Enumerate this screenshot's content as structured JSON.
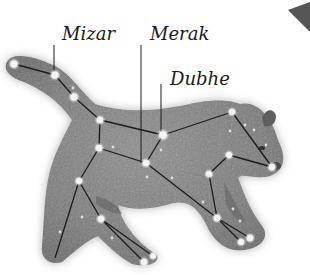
{
  "figure": {
    "labels": [
      {
        "id": "mizar",
        "text": "Mizar",
        "x": 62,
        "y": 25,
        "leader": {
          "x1": 54,
          "y1": 45,
          "x2": 54,
          "y2": 72
        }
      },
      {
        "id": "merak",
        "text": "Merak",
        "x": 150,
        "y": 25,
        "leader": {
          "x1": 141,
          "y1": 45,
          "x2": 141,
          "y2": 163
        }
      },
      {
        "id": "dubhe",
        "text": "Dubhe",
        "x": 170,
        "y": 70,
        "leader": {
          "x1": 161,
          "y1": 84,
          "x2": 161,
          "y2": 133
        }
      }
    ],
    "stars": [
      {
        "name": "tail-tip",
        "x": 14,
        "y": 64,
        "r": 3.5
      },
      {
        "name": "mizar",
        "x": 55,
        "y": 75,
        "r": 3.5
      },
      {
        "name": "alioth",
        "x": 74,
        "y": 97,
        "r": 3.5
      },
      {
        "name": "megrez",
        "x": 100,
        "y": 120,
        "r": 3.2
      },
      {
        "name": "dubhe",
        "x": 163,
        "y": 135,
        "r": 3.8
      },
      {
        "name": "merak",
        "x": 146,
        "y": 163,
        "r": 3.2
      },
      {
        "name": "phecda",
        "x": 99,
        "y": 148,
        "r": 3.2
      },
      {
        "name": "hip",
        "x": 79,
        "y": 181,
        "r": 3
      },
      {
        "name": "back-knee",
        "x": 101,
        "y": 219,
        "r": 3.2
      },
      {
        "name": "back-paw-1",
        "x": 144,
        "y": 262,
        "r": 3.2
      },
      {
        "name": "back-paw-2",
        "x": 153,
        "y": 256,
        "r": 2.8
      },
      {
        "name": "head-top",
        "x": 232,
        "y": 112,
        "r": 3
      },
      {
        "name": "nose",
        "x": 272,
        "y": 167,
        "r": 3.2
      },
      {
        "name": "neck",
        "x": 229,
        "y": 155,
        "r": 3
      },
      {
        "name": "shoulder",
        "x": 209,
        "y": 174,
        "r": 3
      },
      {
        "name": "front-knee",
        "x": 217,
        "y": 218,
        "r": 3.2
      },
      {
        "name": "front-paw-1",
        "x": 241,
        "y": 242,
        "r": 3
      },
      {
        "name": "front-paw-2",
        "x": 250,
        "y": 238,
        "r": 3.2
      }
    ],
    "minor_stars": [
      {
        "x": 49,
        "y": 62
      },
      {
        "x": 73,
        "y": 88
      },
      {
        "x": 98,
        "y": 100
      },
      {
        "x": 245,
        "y": 125
      },
      {
        "x": 266,
        "y": 145
      },
      {
        "x": 254,
        "y": 130
      },
      {
        "x": 172,
        "y": 178
      },
      {
        "x": 147,
        "y": 177
      },
      {
        "x": 42,
        "y": 185
      },
      {
        "x": 60,
        "y": 232
      },
      {
        "x": 112,
        "y": 238
      },
      {
        "x": 203,
        "y": 202
      },
      {
        "x": 233,
        "y": 209
      },
      {
        "x": 240,
        "y": 221
      },
      {
        "x": 161,
        "y": 150
      },
      {
        "x": 113,
        "y": 147
      },
      {
        "x": 82,
        "y": 217
      },
      {
        "x": 230,
        "y": 131
      }
    ],
    "lines": [
      [
        "tail-tip",
        "mizar"
      ],
      [
        "mizar",
        "alioth"
      ],
      [
        "alioth",
        "megrez"
      ],
      [
        "megrez",
        "dubhe"
      ],
      [
        "dubhe",
        "merak"
      ],
      [
        "merak",
        "phecda"
      ],
      [
        "phecda",
        "megrez"
      ],
      [
        "dubhe",
        "head-top"
      ],
      [
        "head-top",
        "nose"
      ],
      [
        "nose",
        "neck"
      ],
      [
        "neck",
        "shoulder"
      ],
      [
        "shoulder",
        "front-knee"
      ],
      [
        "merak",
        "front-knee"
      ],
      [
        "front-knee",
        "front-paw-1"
      ],
      [
        "front-knee",
        "front-paw-2"
      ],
      [
        "phecda",
        "hip"
      ],
      [
        "hip",
        "back-knee"
      ],
      [
        "back-knee",
        "back-paw-1"
      ],
      [
        "back-knee",
        "back-paw-2"
      ]
    ],
    "extra_line": {
      "x1": 79,
      "y1": 181,
      "x2": 55,
      "y2": 258
    },
    "colors": {
      "background": "#ffffff",
      "bear_fill": "#8a8a8a",
      "bear_dark": "#5e5e5e",
      "line": "#1c1c1c",
      "star": "#f4f4f4",
      "label": "#1a1a1a",
      "corner_shape": "#555555"
    }
  }
}
